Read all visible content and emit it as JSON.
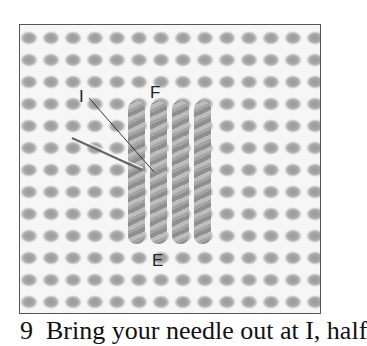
{
  "figure": {
    "labels": {
      "i": "I",
      "f": "F",
      "e": "E"
    },
    "caption": "9  Bring your needle out at I, half",
    "colors": {
      "canvas": "#f6f6f6",
      "hole": "#a0a0a0",
      "thread": "#9e9e9e",
      "frame": "#555555"
    },
    "stitches": 4
  }
}
